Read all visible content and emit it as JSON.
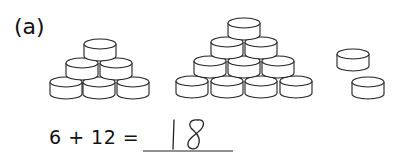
{
  "question": {
    "label": "(a)",
    "groups": [
      {
        "name": "pyramid-small",
        "count": 6,
        "rows": [
          1,
          2,
          3
        ]
      },
      {
        "name": "pyramid-large",
        "count": 10,
        "rows": [
          1,
          2,
          3,
          4
        ]
      },
      {
        "name": "loose",
        "count": 2
      }
    ],
    "equation": "6 + 12 =",
    "answer": "18"
  }
}
